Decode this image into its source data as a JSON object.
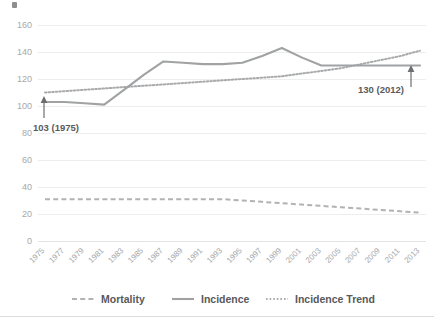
{
  "chart_data": {
    "type": "line",
    "title": "",
    "xlabel": "",
    "ylabel": "",
    "ylim": [
      0,
      160
    ],
    "ytick_step": 20,
    "grid": true,
    "legend_position": "bottom",
    "x": [
      1975,
      1977,
      1979,
      1981,
      1983,
      1985,
      1987,
      1989,
      1991,
      1993,
      1995,
      1997,
      1999,
      2001,
      2003,
      2005,
      2007,
      2009,
      2011,
      2013
    ],
    "categories": [
      "1975",
      "1977",
      "1979",
      "1981",
      "1983",
      "1985",
      "1987",
      "1989",
      "1991",
      "1993",
      "1995",
      "1997",
      "1999",
      "2001",
      "2003",
      "2005",
      "2007",
      "2009",
      "2011",
      "2013"
    ],
    "yticks": [
      "0",
      "20",
      "40",
      "60",
      "80",
      "100",
      "120",
      "140",
      "160"
    ],
    "series": [
      {
        "name": "Mortality",
        "style": "dashed",
        "color": "#b0b2b4",
        "values": [
          31,
          31,
          31,
          31,
          31,
          31,
          31,
          31,
          31,
          31,
          30,
          29,
          28,
          27,
          26,
          25,
          24,
          23,
          22,
          21
        ]
      },
      {
        "name": "Incidence",
        "style": "solid",
        "color": "#a0a2a4",
        "values": [
          103,
          103,
          102,
          101,
          112,
          123,
          133,
          132,
          131,
          131,
          132,
          137,
          143,
          136,
          130,
          130,
          130,
          130,
          130,
          130
        ]
      },
      {
        "name": "Incidence Trend",
        "style": "dotted",
        "color": "#a8aaac",
        "values": [
          110,
          111,
          112,
          113,
          114,
          115,
          116,
          117,
          118,
          119,
          120,
          121,
          122,
          124,
          126,
          128,
          131,
          134,
          137,
          141
        ]
      }
    ],
    "annotations": [
      {
        "label": "103 (1975)",
        "x": 1975,
        "y": 103,
        "series": "Incidence"
      },
      {
        "label": "130 (2012)",
        "x": 2012,
        "y": 130,
        "series": "Incidence"
      }
    ]
  },
  "legend": {
    "items": [
      {
        "label": "Mortality",
        "style": "dashed"
      },
      {
        "label": "Incidence",
        "style": "solid"
      },
      {
        "label": "Incidence Trend",
        "style": "dotted"
      }
    ]
  },
  "colors": {
    "incidence": "#a0a2a4",
    "mortality": "#b0b2b4",
    "trend": "#a8aaac",
    "gridline": "#ededee",
    "tick_text": "#a6a8ab",
    "annotation_text": "#5a5a5c",
    "legend_text": "#58595b"
  }
}
